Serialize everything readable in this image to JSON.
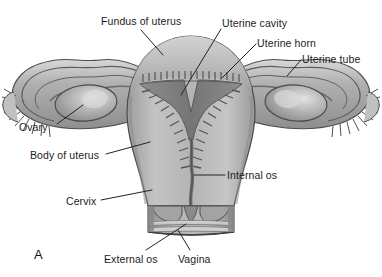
{
  "figure": {
    "panel_letter": "A",
    "view": "Coronal section of the uterus, uterine tubes, ovaries and upper vagina",
    "background_color": "#ffffff",
    "text_color": "#1c1c1c"
  },
  "labels": [
    {
      "id": "fundus-of-uterus",
      "text": "Fundus of uterus"
    },
    {
      "id": "uterine-cavity",
      "text": "Uterine cavity"
    },
    {
      "id": "uterine-horn",
      "text": "Uterine horn"
    },
    {
      "id": "uterine-tube",
      "text": "Uterine tube"
    },
    {
      "id": "ovary",
      "text": "Ovary"
    },
    {
      "id": "body-of-uterus",
      "text": "Body of uterus"
    },
    {
      "id": "internal-os",
      "text": "Internal os"
    },
    {
      "id": "cervix",
      "text": "Cervix"
    },
    {
      "id": "external-os",
      "text": "External os"
    },
    {
      "id": "vagina",
      "text": "Vagina"
    }
  ],
  "structures": {
    "fundus_of_uterus": "Fundus of uterus",
    "uterine_cavity": "Uterine cavity",
    "uterine_horn": "Uterine horn",
    "uterine_tube": "Uterine tube",
    "ovary": "Ovary",
    "body_of_uterus": "Body of uterus",
    "internal_os": "Internal os",
    "cervix": "Cervix",
    "external_os": "External os",
    "vagina": "Vagina"
  },
  "palette": {
    "outline": "#4a4a4a",
    "myometrium_light": "#c9c9c9",
    "myometrium_mid": "#ababab",
    "myometrium_dark": "#8d8d8d",
    "cavity_dark": "#7d7d7d",
    "canal_dark": "#6d6d6d",
    "ovary_fill": "#a8a8a8",
    "ovary_highlight": "#d8d8d8",
    "ligament_light": "#d2d2d2",
    "ligament_mid": "#a2a2a2",
    "vagina_light": "#d6d6d6",
    "leader_line": "#2a2a2a"
  }
}
